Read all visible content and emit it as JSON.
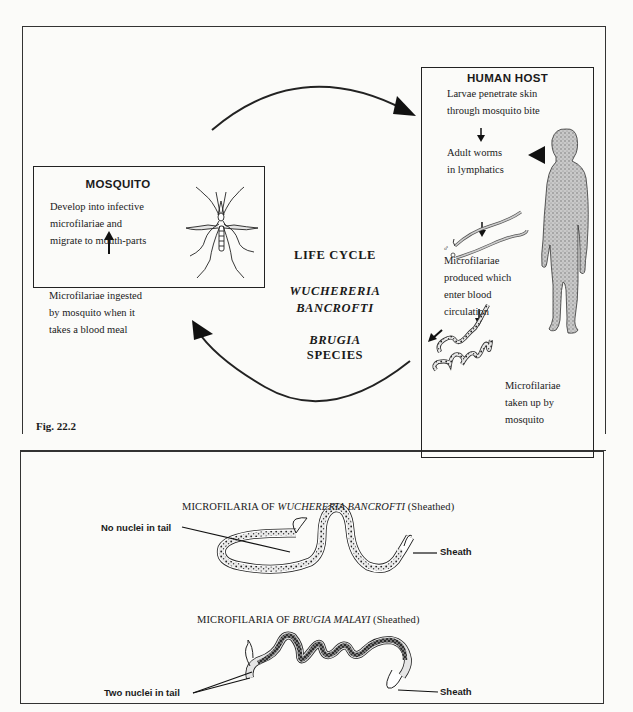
{
  "figure_label": "Fig. 22.2",
  "center": {
    "title": "LIFE CYCLE",
    "genus1_line1": "WUCHERERIA",
    "genus1_line2": "BANCROFTI",
    "genus2": "BRUGIA",
    "genus2_suffix": " SPECIES"
  },
  "mosquito_box": {
    "title": "MOSQUITO",
    "step_develop": [
      "Develop into infective",
      "microfilariae and",
      "migrate to mouth-parts"
    ],
    "step_ingest": [
      "Microfilariae ingested",
      "by mosquito when it",
      "takes a blood meal"
    ]
  },
  "human_box": {
    "title": "HUMAN HOST",
    "step_penetrate": [
      "Larvae penetrate skin",
      "through mosquito bite"
    ],
    "step_adult": [
      "Adult worms",
      "in lymphatics"
    ],
    "step_produced": [
      "Microfilariae",
      "produced which",
      "enter blood",
      "circulation"
    ],
    "step_taken": [
      "Microfilariae",
      "taken up by",
      "mosquito"
    ],
    "sex_symbols": [
      "♂",
      "♀"
    ]
  },
  "microfilaria_wb": {
    "caption_prefix": "MICROFILARIA OF ",
    "caption_species": "WUCHERERIA BANCROFTI",
    "caption_suffix": " (Sheathed)",
    "tail_label": "No nuclei in tail",
    "sheath_label": "Sheath"
  },
  "microfilaria_bm": {
    "caption_prefix": "MICROFILARIA OF ",
    "caption_species": "BRUGIA MALAYI",
    "caption_suffix": " (Sheathed)",
    "tail_label": "Two nuclei in tail",
    "sheath_label": "Sheath"
  }
}
